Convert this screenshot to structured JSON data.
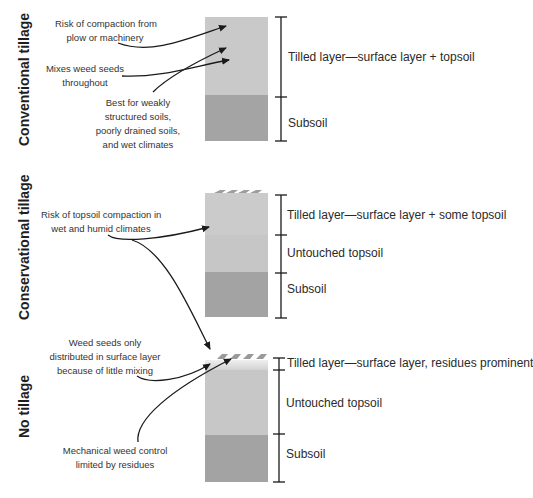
{
  "diagram": {
    "colors": {
      "tilled_layer": "#c8c8c8",
      "untouched_topsoil": "#c6c6c6",
      "subsoil": "#a3a3a3",
      "residue": "#9a9a9a",
      "ink": "#1a1a1a"
    },
    "panels": [
      {
        "title": "Conventional tillage",
        "layers": [
          {
            "label": "Tilled layer—surface layer + topsoil"
          },
          {
            "label": "Subsoil"
          }
        ],
        "notes": [
          {
            "text_lines": [
              "Risk of compaction from",
              "plow or machinery"
            ]
          },
          {
            "text_lines": [
              "Mixes weed seeds",
              "throughout"
            ]
          },
          {
            "text_lines": [
              "Best for weakly",
              "structured soils,",
              "poorly drained soils,",
              "and wet climates"
            ]
          }
        ]
      },
      {
        "title": "Conservational tillage",
        "layers": [
          {
            "label": "Tilled layer—surface layer + some topsoil"
          },
          {
            "label": "Untouched topsoil"
          },
          {
            "label": "Subsoil"
          }
        ],
        "notes": [
          {
            "text_lines": [
              "Risk of topsoil compaction in",
              "wet and humid climates"
            ]
          }
        ]
      },
      {
        "title": "No tillage",
        "layers": [
          {
            "label": "Tilled layer—surface layer, residues prominent"
          },
          {
            "label": "Untouched topsoil"
          },
          {
            "label": "Subsoil"
          }
        ],
        "notes": [
          {
            "text_lines": [
              "Weed seeds only",
              "distributed in surface layer",
              "because of little mixing"
            ]
          },
          {
            "text_lines": [
              "Mechanical weed control",
              "limited by residues"
            ]
          }
        ]
      }
    ]
  }
}
